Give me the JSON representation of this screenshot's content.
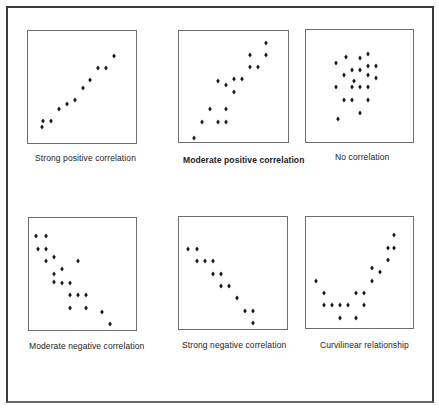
{
  "chart_data": [
    {
      "type": "scatter",
      "title": "Strong positive correlation",
      "box": {
        "left": 27,
        "top": 30,
        "width": 110,
        "height": 114
      },
      "points": [
        [
          41,
          126
        ],
        [
          42,
          120
        ],
        [
          50,
          120
        ],
        [
          58,
          108
        ],
        [
          66,
          103
        ],
        [
          74,
          99
        ],
        [
          82,
          87
        ],
        [
          89,
          79
        ],
        [
          97,
          67
        ],
        [
          105,
          67
        ],
        [
          113,
          55
        ]
      ],
      "caption": {
        "left": 35,
        "top": 153,
        "bold": false
      }
    },
    {
      "type": "scatter",
      "title": "Moderate positive correlation",
      "box": {
        "left": 178,
        "top": 30,
        "width": 111,
        "height": 113
      },
      "points": [
        [
          193,
          137
        ],
        [
          201,
          121
        ],
        [
          209,
          108
        ],
        [
          217,
          121
        ],
        [
          225,
          121
        ],
        [
          225,
          108
        ],
        [
          217,
          80
        ],
        [
          225,
          84
        ],
        [
          233,
          78
        ],
        [
          233,
          91
        ],
        [
          241,
          78
        ],
        [
          249,
          66
        ],
        [
          257,
          66
        ],
        [
          249,
          54
        ],
        [
          265,
          54
        ],
        [
          265,
          42
        ]
      ],
      "caption": {
        "left": 183,
        "top": 155,
        "bold": true
      }
    },
    {
      "type": "scatter",
      "title": "No correlation",
      "box": {
        "left": 305,
        "top": 29,
        "width": 109,
        "height": 114
      },
      "points": [
        [
          335,
          62
        ],
        [
          345,
          56
        ],
        [
          359,
          57
        ],
        [
          367,
          53
        ],
        [
          343,
          74
        ],
        [
          351,
          69
        ],
        [
          359,
          69
        ],
        [
          367,
          65
        ],
        [
          375,
          65
        ],
        [
          367,
          74
        ],
        [
          375,
          77
        ],
        [
          353,
          80
        ],
        [
          335,
          86
        ],
        [
          351,
          86
        ],
        [
          359,
          86
        ],
        [
          367,
          86
        ],
        [
          343,
          99
        ],
        [
          351,
          99
        ],
        [
          367,
          99
        ],
        [
          359,
          112
        ],
        [
          337,
          118
        ]
      ],
      "caption": {
        "left": 335,
        "top": 152,
        "bold": false
      }
    },
    {
      "type": "scatter",
      "title": "Moderate negative correlation",
      "box": {
        "left": 28,
        "top": 217,
        "width": 109,
        "height": 114
      },
      "points": [
        [
          35,
          235
        ],
        [
          45,
          235
        ],
        [
          37,
          248
        ],
        [
          45,
          248
        ],
        [
          45,
          260
        ],
        [
          53,
          256
        ],
        [
          77,
          260
        ],
        [
          61,
          268
        ],
        [
          53,
          273
        ],
        [
          53,
          281
        ],
        [
          61,
          282
        ],
        [
          69,
          282
        ],
        [
          69,
          294
        ],
        [
          77,
          294
        ],
        [
          85,
          294
        ],
        [
          69,
          307
        ],
        [
          85,
          307
        ],
        [
          101,
          311
        ],
        [
          109,
          323
        ]
      ],
      "caption": {
        "left": 29,
        "top": 341,
        "bold": false
      }
    },
    {
      "type": "scatter",
      "title": "Strong negative correlation",
      "box": {
        "left": 178,
        "top": 216,
        "width": 110,
        "height": 114
      },
      "points": [
        [
          187,
          248
        ],
        [
          196,
          248
        ],
        [
          196,
          260
        ],
        [
          204,
          260
        ],
        [
          212,
          260
        ],
        [
          212,
          273
        ],
        [
          220,
          273
        ],
        [
          220,
          285
        ],
        [
          228,
          285
        ],
        [
          236,
          297
        ],
        [
          244,
          310
        ],
        [
          252,
          310
        ],
        [
          252,
          322
        ]
      ],
      "caption": {
        "left": 182,
        "top": 340,
        "bold": false
      }
    },
    {
      "type": "scatter",
      "title": "Curvilinear relationship",
      "box": {
        "left": 305,
        "top": 216,
        "width": 109,
        "height": 113
      },
      "points": [
        [
          315,
          280
        ],
        [
          323,
          292
        ],
        [
          323,
          304
        ],
        [
          331,
          304
        ],
        [
          339,
          304
        ],
        [
          339,
          317
        ],
        [
          347,
          304
        ],
        [
          355,
          292
        ],
        [
          355,
          317
        ],
        [
          363,
          292
        ],
        [
          363,
          304
        ],
        [
          371,
          280
        ],
        [
          371,
          267
        ],
        [
          379,
          271
        ],
        [
          387,
          259
        ],
        [
          387,
          247
        ],
        [
          393,
          247
        ],
        [
          393,
          234
        ]
      ],
      "caption": {
        "left": 320,
        "top": 340,
        "bold": false
      }
    }
  ],
  "captions": [
    "Strong positive correlation",
    "Moderate positive correlation",
    "No correlation",
    "Moderate negative correlation",
    "Strong negative correlation",
    "Curvilinear relationship"
  ],
  "colors": {
    "point": "#1a1a1a",
    "box_border": "#6e6e6e",
    "frame_border": "#3a3a3a"
  }
}
